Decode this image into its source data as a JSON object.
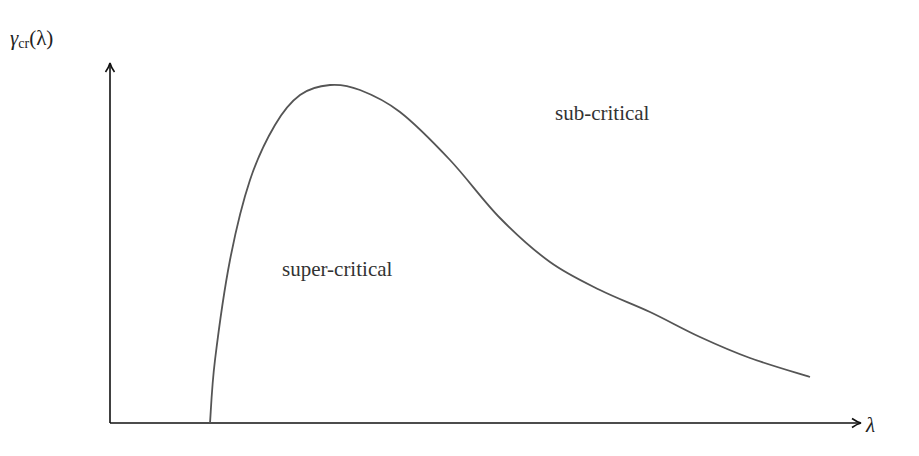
{
  "chart_data": {
    "type": "line",
    "title": "",
    "xlabel": "λ",
    "ylabel": "γ_cr(λ)",
    "ylabel_parts": {
      "symbol": "γ",
      "subscript": "cr",
      "arg": "(λ)"
    },
    "grid": false,
    "ticks": false,
    "annotations": [
      {
        "text": "sub-critical",
        "x_px": 555,
        "y_px": 103
      },
      {
        "text": "super-critical",
        "x_px": 282,
        "y_px": 258
      }
    ],
    "series": [
      {
        "name": "γ_cr(λ)",
        "color": "#555555",
        "points_px": [
          [
            210,
            423
          ],
          [
            215,
            360
          ],
          [
            230,
            260
          ],
          [
            250,
            180
          ],
          [
            275,
            125
          ],
          [
            300,
            95
          ],
          [
            330,
            85
          ],
          [
            360,
            90
          ],
          [
            400,
            112
          ],
          [
            450,
            160
          ],
          [
            500,
            218
          ],
          [
            550,
            262
          ],
          [
            600,
            290
          ],
          [
            650,
            312
          ],
          [
            700,
            337
          ],
          [
            750,
            358
          ],
          [
            810,
            377
          ]
        ]
      }
    ],
    "axes": {
      "origin_px": [
        110,
        423
      ],
      "x_end_px": [
        862,
        423
      ],
      "y_end_px": [
        110,
        62
      ]
    }
  },
  "labels": {
    "y_symbol": "γ",
    "y_sub": "cr",
    "y_arg": "(λ)",
    "x": "λ",
    "sub_critical": "sub-critical",
    "super_critical": "super-critical"
  },
  "colors": {
    "axis": "#111111",
    "curve": "#555555",
    "text": "#333333"
  }
}
